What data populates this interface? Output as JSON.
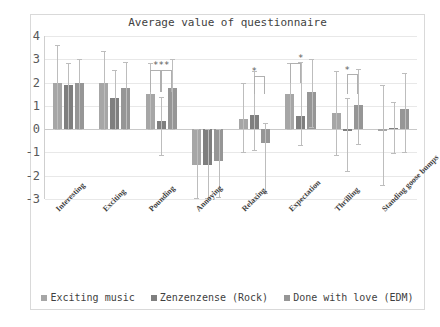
{
  "chart_data": {
    "type": "bar",
    "title": "Average value of questionnaire",
    "xlabel": "",
    "ylabel": "",
    "ylim": [
      -3,
      4
    ],
    "yticks": [
      4,
      3,
      2,
      1,
      0,
      -1,
      -2,
      -3
    ],
    "grid": true,
    "legend_position": "bottom",
    "categories": [
      "Interesting",
      "Exciting",
      "Pounding",
      "Annoying",
      "Relaxing",
      "Expectation",
      "Thrilling",
      "Standing goose bumps"
    ],
    "series": [
      {
        "name": "Exciting music",
        "color": "#a6a6a6",
        "values": [
          2.0,
          2.0,
          1.5,
          -1.55,
          0.45,
          1.5,
          0.7,
          -0.1
        ],
        "errors_upper": [
          1.6,
          1.35,
          1.35,
          1.55,
          1.55,
          1.35,
          1.8,
          2.0
        ],
        "errors_lower": [
          2.0,
          2.0,
          1.5,
          1.4,
          1.45,
          1.5,
          1.8,
          2.3
        ]
      },
      {
        "name": "Zenzenzense (Rock)",
        "color": "#7f7f7f",
        "values": [
          1.9,
          1.35,
          0.35,
          -1.55,
          0.6,
          0.55,
          -0.1,
          0.07
        ],
        "errors_upper": [
          0.95,
          1.2,
          1.05,
          1.55,
          1.9,
          2.35,
          1.45,
          1.1
        ],
        "errors_lower": [
          1.9,
          1.35,
          1.45,
          1.4,
          1.5,
          1.25,
          1.7,
          1.1
        ]
      },
      {
        "name": "Done with love (EDM)",
        "color": "#969696",
        "values": [
          2.0,
          1.75,
          1.75,
          -1.35,
          -0.6,
          1.6,
          1.05,
          0.85
        ],
        "errors_upper": [
          1.0,
          1.15,
          1.25,
          1.35,
          0.85,
          1.4,
          1.55,
          1.55
        ],
        "errors_lower": [
          2.0,
          1.75,
          1.75,
          1.55,
          2.15,
          1.5,
          1.7,
          1.85
        ]
      }
    ],
    "annotations": [
      {
        "label": "***",
        "category": "Pounding"
      },
      {
        "label": "*",
        "category": "Relaxing"
      },
      {
        "label": "*",
        "category": "Expectation"
      },
      {
        "label": "*",
        "category": "Thrilling"
      }
    ]
  }
}
